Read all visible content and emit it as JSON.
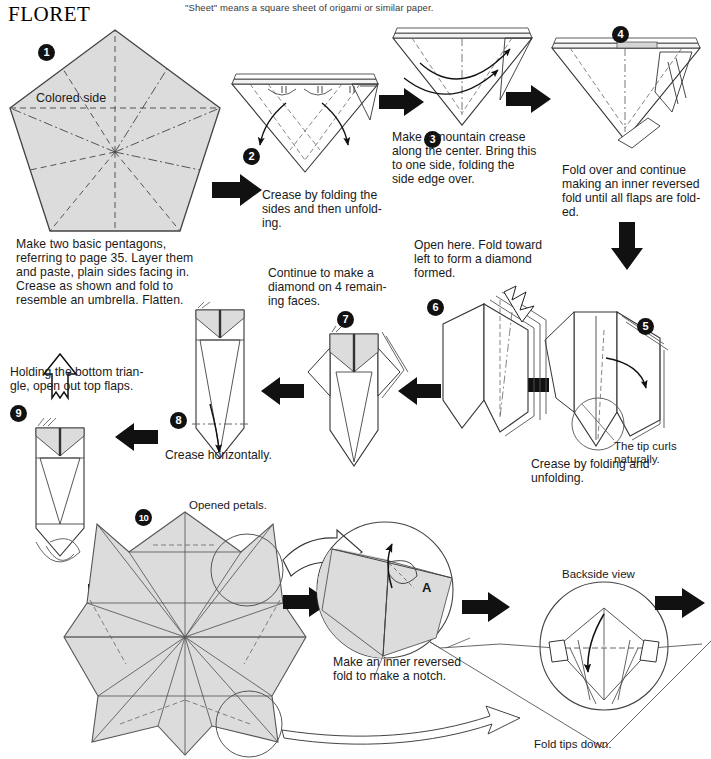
{
  "page": {
    "title": "FLORET",
    "header_note": "\"Sheet\" means a square sheet of origami or similar paper.",
    "width": 711,
    "height": 759
  },
  "colors": {
    "paper_fill": "#dcdcdc",
    "paper_stroke": "#333333",
    "line": "#222222",
    "arrow_solid": "#000000",
    "arrow_hollow_fill": "#ffffff",
    "text": "#1a1a1a",
    "badge_bg": "#111111",
    "badge_text": "#ffffff"
  },
  "steps": [
    {
      "number": "1",
      "badge": "❶",
      "label_in_figure": "Colored side",
      "caption": "Make two basic pentagons,\nreferring to page 35. Layer them\nand paste, plain sides facing in.\nCrease as shown and fold to\nresemble an umbrella. Flatten."
    },
    {
      "number": "2",
      "badge": "❷",
      "caption": "Crease by folding the\nsides and then unfold-\ning."
    },
    {
      "number": "3",
      "badge": "❸",
      "caption": "Make a mountain crease\nalong the center. Bring this\nto one side, folding the\nside edge over."
    },
    {
      "number": "4",
      "badge": "❹",
      "caption": "Fold over and continue\nmaking an inner reversed\nfold until all flaps are fold-\ned."
    },
    {
      "number": "5",
      "badge": "❺",
      "caption": "Crease by folding and\nunfolding.",
      "note": "The tip curls\nnaturally."
    },
    {
      "number": "6",
      "badge": "❻",
      "caption": "Open here. Fold toward\nleft to form a diamond\nformed."
    },
    {
      "number": "7",
      "badge": "❼",
      "caption": "Continue to make a\ndiamond on 4 remain-\ning faces."
    },
    {
      "number": "8",
      "badge": "❽",
      "caption": "Crease horizontally."
    },
    {
      "number": "9",
      "badge": "❾",
      "caption": "Holding the bottom trian-\ngle, open out top flaps."
    },
    {
      "number": "10",
      "badge": "❿",
      "caption": "Opened petals."
    },
    {
      "number": "11",
      "badge": "",
      "caption": "Make an inner reversed\nfold to make a notch.",
      "label_in_figure": "A"
    },
    {
      "number": "12",
      "badge": "",
      "caption": "Fold tips down.",
      "label_in_figure": "Backside view"
    }
  ],
  "annotations": {
    "colored_side": "Colored side",
    "tip_curls": "The tip curls\nnaturally.",
    "opened_petals": "Opened petals.",
    "point_a": "A",
    "backside_view": "Backside view",
    "fold_tips_down": "Fold tips down."
  },
  "icons": {
    "arrow_right": "arrow-right-icon",
    "arrow_left": "arrow-left-icon",
    "arrow_down": "arrow-down-icon",
    "arrow_hollow": "hollow-arrow-icon",
    "fold_arrow": "fold-arrow-icon"
  }
}
